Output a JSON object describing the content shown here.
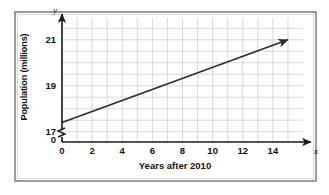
{
  "chart_data": {
    "type": "line",
    "title": "",
    "subtitle": "",
    "xlabel": "Years after 2010",
    "ylabel": "Population (millions)",
    "x_axis_variable": "x",
    "y_axis_variable": "y",
    "xlim": [
      0,
      15.6
    ],
    "ylim": [
      16.55,
      21.6
    ],
    "y_axis_break": true,
    "y_axis_break_note": "axis broken between 0 and 17",
    "grid": true,
    "grid_x_interval": 1,
    "grid_y_interval": 0.5,
    "legend": "none",
    "xticks": [
      0,
      2,
      4,
      6,
      8,
      10,
      12,
      14
    ],
    "xtick_labels": [
      "0",
      "2",
      "4",
      "6",
      "8",
      "10",
      "12",
      "14"
    ],
    "yticks": [
      17,
      19,
      21
    ],
    "ytick_labels": [
      "17",
      "19",
      "21"
    ],
    "y_origin_label": "0",
    "series": [
      {
        "name": "Population",
        "x": [
          0,
          15
        ],
        "values": [
          17.4,
          21.0
        ],
        "points": [
          [
            0,
            17.4
          ],
          [
            2,
            17.88
          ],
          [
            4,
            18.36
          ],
          [
            6,
            18.84
          ],
          [
            8,
            19.32
          ],
          [
            10,
            19.8
          ],
          [
            12,
            20.28
          ],
          [
            14,
            20.76
          ],
          [
            15,
            21.0
          ]
        ],
        "slope": 0.24,
        "intercept": 17.4,
        "arrow_end": true,
        "color": "#2b2b2b"
      }
    ]
  },
  "colors": {
    "line": "#2b2b2b",
    "axis": "#1a1a1a",
    "grid": "#cfcfcf",
    "frame_outer": "#9b9b9b",
    "frame_inner": "#d8d8d8",
    "background": "#ffffff",
    "text": "#111111"
  }
}
